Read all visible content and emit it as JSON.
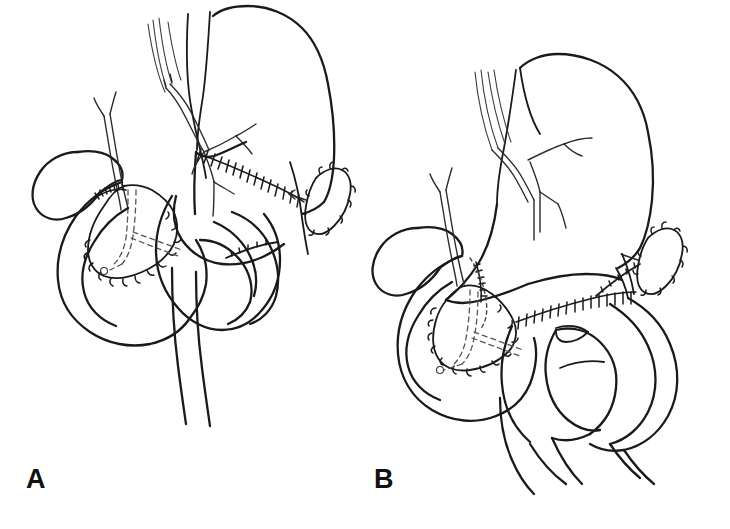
{
  "figure": {
    "width": 730,
    "height": 529,
    "background_color": "#ffffff",
    "ink_color": "#1a1a1a",
    "style": "black ink line drawing, medical illustration, two panels"
  },
  "panels": [
    {
      "id": "A",
      "label": "A",
      "label_x": 26,
      "label_y": 466,
      "description": "Surgical reconstruction after pancreaticoduodenectomy, variant A",
      "structures": [
        "esophagus",
        "vagus-nerve-trunks",
        "stomach",
        "gastrojejunal-anastomosis-suture-line",
        "gallbladder",
        "cystic-duct",
        "common-bile-duct",
        "pancreas-remnant",
        "pancreatic-duct",
        "spleen",
        "duodenum",
        "jejunal-limb",
        "afferent-limb",
        "efferent-limb"
      ]
    },
    {
      "id": "B",
      "label": "B",
      "label_x": 374,
      "label_y": 466,
      "description": "Surgical reconstruction after pancreaticoduodenectomy, variant B with additional Roux-en-Y jejunal loop",
      "structures": [
        "esophagus",
        "vagus-nerve-trunks",
        "stomach",
        "gastrojejunal-anastomosis-suture-line",
        "gallbladder",
        "cystic-duct",
        "common-bile-duct",
        "pancreas-remnant",
        "pancreatic-duct",
        "spleen",
        "duodenum",
        "jejunal-limb",
        "roux-en-y-loop",
        "afferent-limb",
        "efferent-limb"
      ]
    }
  ]
}
